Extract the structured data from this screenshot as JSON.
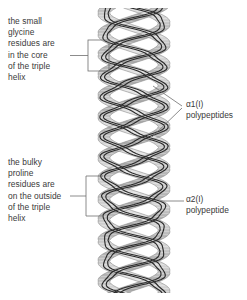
{
  "figure": {
    "background_color": "#ffffff",
    "text_color": "#3a3a3a"
  },
  "callouts": {
    "glycine": {
      "text": "the small\nglycine\nresidues are\nin the core\nof the triple\nhelix",
      "lines": [
        "the small",
        "glycine",
        "residues are",
        "in the core",
        "of the triple",
        "helix"
      ],
      "bracket_shape": "rectangle"
    },
    "proline": {
      "text": "the bulky\nproline\nresidues are\non the outside\nof the triple\nhelix",
      "lines": [
        "the bulky",
        "proline",
        "residues are",
        "on the outside",
        "of the triple",
        "helix"
      ],
      "bracket_shape": "square-bracket"
    }
  },
  "labels": {
    "alpha1": {
      "text": "α1(I)\npolypeptides",
      "chain_name": "α1(I)",
      "descriptor": "polypeptides",
      "leader_style": "forked"
    },
    "alpha2": {
      "text": "α2(I)\npolypeptide",
      "chain_name": "α2(I)",
      "descriptor": "polypeptide",
      "leader_style": "straight"
    }
  },
  "helix": {
    "description": "three intertwined polypeptide ribbons forming a triple helix",
    "strand_count": 3,
    "ribbon_fill": "#c9c9c9",
    "ribbon_edge": "#8a8a8a",
    "chain_line_color": "#2b2b2b",
    "axis_x": 134,
    "top_y": 8,
    "bottom_y": 293,
    "radius": 30,
    "turn_period": 62,
    "leader_color": "#6e6e6e"
  }
}
